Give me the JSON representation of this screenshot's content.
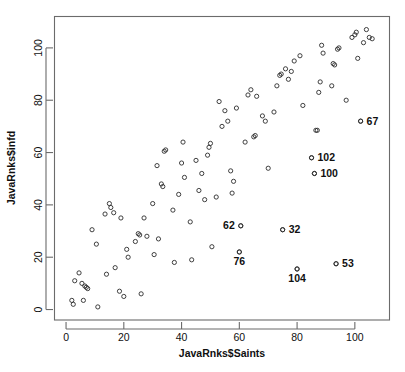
{
  "chart_data": {
    "type": "scatter",
    "title": "",
    "xlabel": "JavaRnks$Saints",
    "ylabel": "JavaRnks$infd",
    "xlim": [
      -4,
      112
    ],
    "ylim": [
      -4,
      112
    ],
    "xticks": [
      0,
      20,
      40,
      60,
      80,
      100
    ],
    "yticks": [
      0,
      20,
      40,
      60,
      80,
      100
    ],
    "grid": false,
    "legend": null,
    "marker": "open-circle",
    "points": [
      [
        2,
        3.5
      ],
      [
        3,
        11
      ],
      [
        2.5,
        2
      ],
      [
        4.5,
        14
      ],
      [
        5.5,
        10
      ],
      [
        6.5,
        9
      ],
      [
        7,
        8.5
      ],
      [
        7.5,
        8
      ],
      [
        6,
        3.5
      ],
      [
        9,
        30.5
      ],
      [
        10.5,
        25
      ],
      [
        11,
        1
      ],
      [
        13.5,
        36.5
      ],
      [
        14,
        13.5
      ],
      [
        15,
        40.5
      ],
      [
        15.5,
        39
      ],
      [
        16.5,
        37
      ],
      [
        17,
        16
      ],
      [
        18.5,
        7
      ],
      [
        19,
        35
      ],
      [
        20,
        5
      ],
      [
        21,
        23
      ],
      [
        21.5,
        20
      ],
      [
        24,
        26
      ],
      [
        25,
        29
      ],
      [
        25.5,
        28.5
      ],
      [
        26,
        6
      ],
      [
        27,
        35
      ],
      [
        28,
        28
      ],
      [
        30,
        40.5
      ],
      [
        30.5,
        21
      ],
      [
        31.5,
        55
      ],
      [
        32,
        27
      ],
      [
        33,
        48
      ],
      [
        33.5,
        47
      ],
      [
        34,
        60.5
      ],
      [
        34.5,
        61
      ],
      [
        37,
        38
      ],
      [
        37.5,
        18
      ],
      [
        39,
        44
      ],
      [
        40,
        56
      ],
      [
        40.5,
        64
      ],
      [
        41,
        50.5
      ],
      [
        43,
        33.5
      ],
      [
        43.5,
        19
      ],
      [
        45,
        57
      ],
      [
        46,
        45.5
      ],
      [
        47,
        52
      ],
      [
        48,
        42
      ],
      [
        49,
        59
      ],
      [
        49.5,
        62
      ],
      [
        50,
        63.5
      ],
      [
        50.5,
        24
      ],
      [
        52,
        43
      ],
      [
        53,
        79.5
      ],
      [
        54,
        70
      ],
      [
        55,
        76
      ],
      [
        56,
        72
      ],
      [
        57,
        53
      ],
      [
        57.5,
        44.5
      ],
      [
        58,
        49
      ],
      [
        59,
        77
      ],
      [
        60,
        22
      ],
      [
        60.5,
        32
      ],
      [
        62,
        64
      ],
      [
        63,
        82
      ],
      [
        64,
        84
      ],
      [
        65,
        66
      ],
      [
        65.5,
        66.5
      ],
      [
        66,
        81.5
      ],
      [
        68,
        74
      ],
      [
        69,
        72
      ],
      [
        70,
        54
      ],
      [
        72,
        75.5
      ],
      [
        73,
        85.5
      ],
      [
        74,
        89.5
      ],
      [
        74.5,
        90
      ],
      [
        75,
        30.5
      ],
      [
        76,
        92
      ],
      [
        77,
        88
      ],
      [
        78,
        91
      ],
      [
        79,
        95
      ],
      [
        80,
        15.5
      ],
      [
        81,
        97
      ],
      [
        82,
        78
      ],
      [
        85,
        58
      ],
      [
        86,
        52
      ],
      [
        86.5,
        68.5
      ],
      [
        87,
        68.5
      ],
      [
        87.5,
        83
      ],
      [
        88,
        87
      ],
      [
        88.5,
        101
      ],
      [
        89,
        98
      ],
      [
        92,
        85.5
      ],
      [
        92.5,
        94
      ],
      [
        93,
        93.5
      ],
      [
        93.5,
        17.5
      ],
      [
        94,
        99.5
      ],
      [
        94.5,
        100
      ],
      [
        97,
        80
      ],
      [
        99,
        104
      ],
      [
        100,
        105
      ],
      [
        100.5,
        106
      ],
      [
        101,
        96
      ],
      [
        102,
        72
      ],
      [
        103,
        102
      ],
      [
        104,
        107
      ],
      [
        105,
        104
      ],
      [
        106,
        103.5
      ]
    ],
    "labeled_points": [
      {
        "id": "67",
        "x": 102,
        "y": 72,
        "label_side": "right"
      },
      {
        "id": "102",
        "x": 85,
        "y": 58,
        "label_side": "right"
      },
      {
        "id": "100",
        "x": 86,
        "y": 52,
        "label_side": "right"
      },
      {
        "id": "62",
        "x": 60.5,
        "y": 32,
        "label_side": "left"
      },
      {
        "id": "32",
        "x": 75,
        "y": 30.5,
        "label_side": "right"
      },
      {
        "id": "76",
        "x": 60,
        "y": 22,
        "label_side": "below"
      },
      {
        "id": "53",
        "x": 93.5,
        "y": 17.5,
        "label_side": "right"
      },
      {
        "id": "104",
        "x": 80,
        "y": 15.5,
        "label_side": "below"
      }
    ]
  },
  "colors": {
    "background": "#ffffff",
    "frame": "#6b6b6b",
    "point": "#2b2b2b",
    "text": "#101010"
  }
}
